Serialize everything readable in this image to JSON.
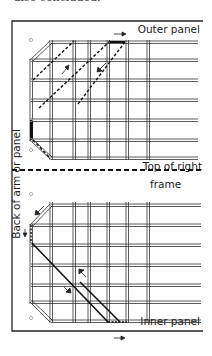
{
  "intro_text": "also concluded.",
  "labels": {
    "outer_panel": "Outer panel",
    "top_of_right": "Top of right",
    "frame": "frame",
    "side": "Back of arm or panel",
    "inner_panel": "Inner panel"
  },
  "colors": {
    "line": "#222222",
    "hole": "#999999"
  }
}
